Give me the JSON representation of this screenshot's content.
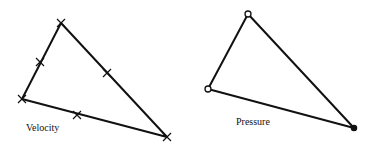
{
  "diagram": {
    "type": "two-triangle-element-diagram",
    "stroke_color": "#111111",
    "background": "#ffffff",
    "velocity": {
      "label": "Velocity",
      "label_pos": [
        26,
        123
      ],
      "vertices": [
        [
          61,
          23
        ],
        [
          22,
          99
        ],
        [
          167,
          137
        ]
      ],
      "node_marker": "cross",
      "midside_nodes": [
        [
          40,
          62
        ],
        [
          107,
          73
        ],
        [
          77,
          115
        ]
      ],
      "description": "Quadratic triangle: velocity nodes at 3 vertices and 3 edge midpoints (marked with x)"
    },
    "pressure": {
      "label": "Pressure",
      "label_pos": [
        236,
        117
      ],
      "vertices": [
        [
          248,
          14
        ],
        [
          208,
          89
        ],
        [
          354,
          128
        ]
      ],
      "node_marker": "circle",
      "description": "Linear triangle: pressure nodes at 3 vertices only (marked with o)"
    }
  }
}
